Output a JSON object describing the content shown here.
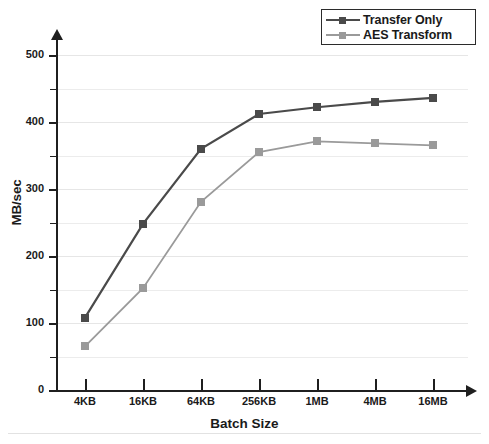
{
  "chart_data": {
    "type": "line",
    "title": "",
    "xlabel": "Batch Size",
    "ylabel": "MB/sec",
    "categories": [
      "4KB",
      "16KB",
      "64KB",
      "256KB",
      "1MB",
      "4MB",
      "16MB"
    ],
    "series": [
      {
        "name": "Transfer Only",
        "color": "#4a4a4a",
        "marker": "square",
        "values": [
          108,
          248,
          360,
          412,
          422,
          430,
          436
        ]
      },
      {
        "name": "AES Transform",
        "color": "#9a9a9a",
        "marker": "square",
        "values": [
          65,
          152,
          281,
          355,
          371,
          368,
          365
        ]
      }
    ],
    "ylim": [
      0,
      500
    ],
    "ytick_labels": [
      "0",
      "100",
      "200",
      "300",
      "400",
      "500"
    ],
    "ytick_values": [
      0,
      100,
      200,
      300,
      400,
      500
    ],
    "yminor_values": [
      50,
      150,
      250,
      350,
      450
    ],
    "grid": true,
    "legend_position": "top-right"
  },
  "legend": {
    "entries": [
      {
        "label": "Transfer Only",
        "color": "#4a4a4a"
      },
      {
        "label": "AES Transform",
        "color": "#9a9a9a"
      }
    ]
  },
  "footer": {
    "caption": ""
  }
}
